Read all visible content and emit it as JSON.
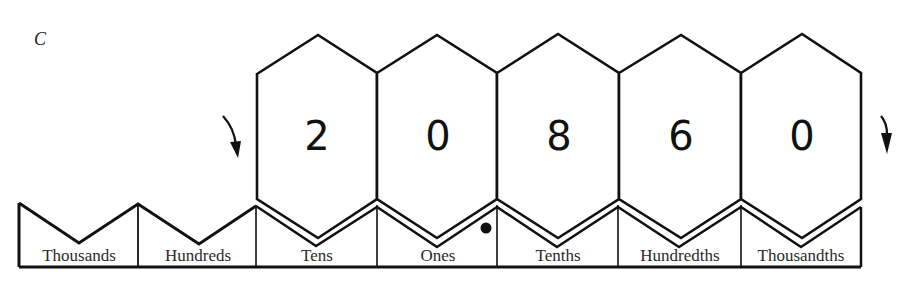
{
  "figure": {
    "caption_letter": "C",
    "stroke_color": "#111111",
    "background": "#ffffff"
  },
  "number": {
    "digits": [
      "2",
      "0",
      "8",
      "6",
      "0"
    ],
    "decimal_point_after_position": "Ones"
  },
  "places": [
    {
      "label": "Thousands",
      "digit": null
    },
    {
      "label": "Hundreds",
      "digit": null
    },
    {
      "label": "Tens",
      "digit": "2"
    },
    {
      "label": "Ones",
      "digit": "0"
    },
    {
      "label": "Tenths",
      "digit": "8"
    },
    {
      "label": "Hundredths",
      "digit": "6"
    },
    {
      "label": "Thousandths",
      "digit": "0"
    }
  ],
  "arrows": [
    {
      "name": "left-arrow",
      "direction": "down"
    },
    {
      "name": "right-arrow",
      "direction": "down"
    }
  ]
}
